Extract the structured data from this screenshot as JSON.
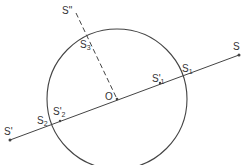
{
  "diagram": {
    "type": "geometry-circle-with-lines",
    "stroke_color": "#444444",
    "background": "#ffffff",
    "circle": {
      "cx": 117,
      "cy": 99,
      "r": 70
    },
    "center": {
      "label": "O",
      "x": 117,
      "y": 99
    },
    "main_line": {
      "from": "S'",
      "to": "S"
    },
    "dashed_line": {
      "from": "O",
      "to": "S\""
    },
    "points": {
      "S": {
        "label": "S",
        "x": 239,
        "y": 55
      },
      "S_prime": {
        "label": "S'",
        "x": 10,
        "y": 140
      },
      "S_double_prime": {
        "label": "S\"",
        "x": 76,
        "y": 13
      },
      "S1": {
        "label": "S",
        "sub": "1",
        "x": 183,
        "y": 74
      },
      "S1_prime": {
        "label": "S'",
        "sub": "1",
        "x": 160,
        "y": 83
      },
      "S2": {
        "label": "S",
        "sub": "2",
        "x": 51,
        "y": 124
      },
      "S2_prime": {
        "label": "S'",
        "sub": "2",
        "x": 57,
        "y": 121
      },
      "S3": {
        "label": "S",
        "sub": "3",
        "x": 88,
        "y": 35
      }
    }
  }
}
